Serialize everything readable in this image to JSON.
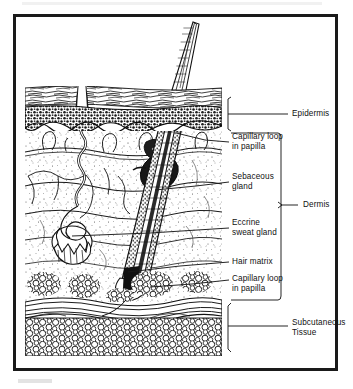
{
  "figure": {
    "type": "anatomical-diagram"
  },
  "layer_brackets": [
    {
      "id": "epidermis",
      "label": "Epidermis",
      "label_x": 292,
      "label_y": 110,
      "bracket_x": 228,
      "bracket_top": 97,
      "bracket_bottom": 130,
      "tick_y": 114,
      "leader_to_x": 288
    },
    {
      "id": "dermis",
      "label": "Dermis",
      "label_x": 303,
      "label_y": 205,
      "bracket_x": 281,
      "bracket_top": 133,
      "bracket_bottom": 300,
      "tick_y": 205,
      "leader_to_x": 298
    },
    {
      "id": "subcutaneous",
      "label": "Subcutaneous\nTissue",
      "label_x": 292,
      "label_y": 318,
      "bracket_x": 228,
      "bracket_top": 303,
      "bracket_bottom": 352,
      "tick_y": 326,
      "leader_to_x": 288
    }
  ],
  "callouts": [
    {
      "id": "capillary-loop-upper",
      "label": "Capillary loop\nin papilla",
      "text_x": 232,
      "text_y": 137,
      "leader": {
        "x1": 229,
        "y1": 142,
        "x2": 176,
        "y2": 133
      }
    },
    {
      "id": "sebaceous-gland",
      "label": "Sebaceous\ngland",
      "text_x": 232,
      "text_y": 177,
      "leader": {
        "x1": 229,
        "y1": 182,
        "x2": 155,
        "y2": 190
      }
    },
    {
      "id": "eccrine-sweat-gland",
      "label": "Eccrine\nsweat gland",
      "text_x": 232,
      "text_y": 223,
      "leader": {
        "x1": 229,
        "y1": 228,
        "x2": 72,
        "y2": 236
      }
    },
    {
      "id": "hair-matrix",
      "label": "Hair matrix",
      "text_x": 232,
      "text_y": 258,
      "leader": {
        "x1": 229,
        "y1": 262,
        "x2": 128,
        "y2": 272
      }
    },
    {
      "id": "capillary-loop-lower",
      "label": "Capillary loop\nin papilla",
      "text_x": 232,
      "text_y": 275,
      "leader": {
        "x1": 229,
        "y1": 280,
        "x2": 150,
        "y2": 287
      }
    }
  ],
  "anatomy": {
    "stratum_corneum": {
      "top": 88,
      "bottom": 106,
      "left": 25,
      "right": 222
    },
    "basal_layer": {
      "top": 107,
      "bottom": 131,
      "left": 25,
      "right": 222
    },
    "dermis_field": {
      "top": 131,
      "bottom": 300,
      "left": 25,
      "right": 222
    },
    "fat_upper": {
      "top": 272,
      "bottom": 300
    },
    "fascia_band": {
      "top": 300,
      "bottom": 318
    },
    "fat_lower": {
      "top": 318,
      "bottom": 355
    },
    "hair_shaft": {
      "emerge_x": 178,
      "emerge_y": 88,
      "tip_x": 196,
      "tip_y": 22
    },
    "follicle": {
      "top_x": 170,
      "top_y": 92,
      "bulb_x": 118,
      "bulb_y": 285
    },
    "sweat_gland_coil": {
      "cx": 72,
      "cy": 238,
      "r": 20
    },
    "sweat_duct": {
      "pore_x": 82,
      "pore_y": 99
    }
  },
  "colors": {
    "frame": "#1a1a1a",
    "ink": "#111111",
    "paper": "#ffffff",
    "leader": "#1a1a1a"
  }
}
